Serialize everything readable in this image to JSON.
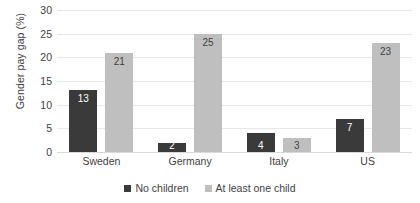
{
  "chart_data": {
    "type": "bar",
    "title": "",
    "xlabel": "",
    "ylabel": "Gender pay gap (%)",
    "ylim": [
      0,
      30
    ],
    "yticks": [
      0,
      5,
      10,
      15,
      20,
      25,
      30
    ],
    "grid": "horizontal",
    "legend_position": "bottom",
    "categories": [
      "Sweden",
      "Germany",
      "Italy",
      "US"
    ],
    "series": [
      {
        "name": "No children",
        "color": "#3A3A3A",
        "values": [
          13,
          2,
          4,
          7
        ]
      },
      {
        "name": "At least one child",
        "color": "#BFBFBF",
        "values": [
          21,
          25,
          3,
          23
        ]
      }
    ]
  },
  "axis": {
    "y_title": "Gender pay gap (%)",
    "y_tick_labels": [
      "30",
      "25",
      "20",
      "15",
      "10",
      "5",
      "0"
    ]
  },
  "legend": {
    "items": [
      {
        "label": "No children",
        "color": "#3A3A3A",
        "swatch": "square-swatch-icon"
      },
      {
        "label": "At least one child",
        "color": "#BFBFBF",
        "swatch": "square-swatch-icon"
      }
    ]
  }
}
